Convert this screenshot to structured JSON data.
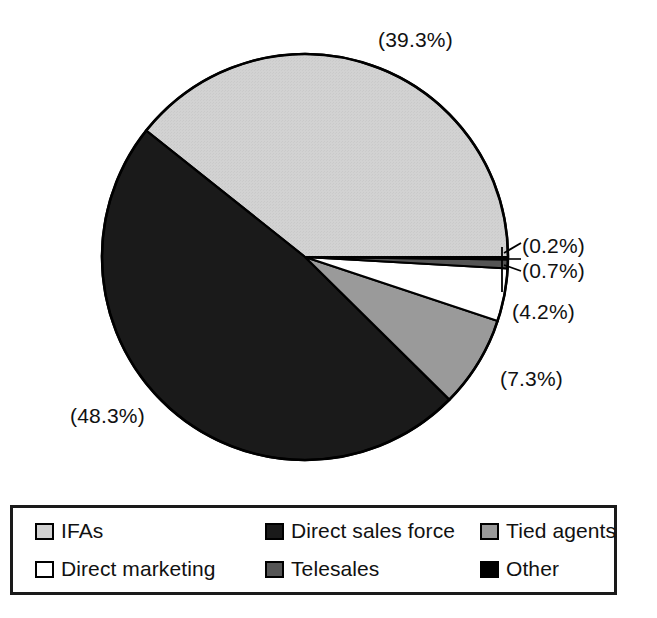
{
  "chart_data": {
    "type": "pie",
    "title": "",
    "subtitle": "",
    "xlabel": "",
    "ylabel": "",
    "units": "percent",
    "legend_position": "bottom",
    "grid": false,
    "start_angle_deg": 0,
    "direction": "counterclockwise",
    "categories": [
      "IFAs",
      "Direct sales force",
      "Tied agents",
      "Direct marketing",
      "Telesales",
      "Other"
    ],
    "values": [
      39.3,
      48.3,
      7.3,
      4.2,
      0.7,
      0.2
    ],
    "value_labels": [
      "(39.3%)",
      "(48.3%)",
      "(7.3%)",
      "(4.2%)",
      "(0.7%)",
      "(0.2%)"
    ],
    "slices": [
      {
        "name": "IFAs",
        "value": 39.3,
        "label": "(39.3%)",
        "color": "#d2d2d2",
        "order": 1
      },
      {
        "name": "Direct sales force",
        "value": 48.3,
        "label": "(48.3%)",
        "color": "#1a1a1a",
        "order": 2
      },
      {
        "name": "Tied agents",
        "value": 7.3,
        "label": "(7.3%)",
        "color": "#9a9a9a",
        "order": 3
      },
      {
        "name": "Direct marketing",
        "value": 4.2,
        "label": "(4.2%)",
        "color": "#ffffff",
        "order": 4
      },
      {
        "name": "Telesales",
        "value": 0.7,
        "label": "(0.7%)",
        "color": "#555555",
        "order": 5
      },
      {
        "name": "Other",
        "value": 0.2,
        "label": "(0.2%)",
        "color": "#000000",
        "order": 6
      }
    ]
  },
  "legend": {
    "items": [
      {
        "label": "IFAs",
        "color": "#d2d2d2"
      },
      {
        "label": "Direct sales force",
        "color": "#1a1a1a"
      },
      {
        "label": "Tied agents",
        "color": "#9a9a9a"
      },
      {
        "label": "Direct marketing",
        "color": "#ffffff"
      },
      {
        "label": "Telesales",
        "color": "#555555"
      },
      {
        "label": "Other",
        "color": "#000000"
      }
    ]
  },
  "colors": {
    "outline": "#000000",
    "legend_border": "#1a1a1a",
    "text": "#111111",
    "background": "#ffffff"
  }
}
